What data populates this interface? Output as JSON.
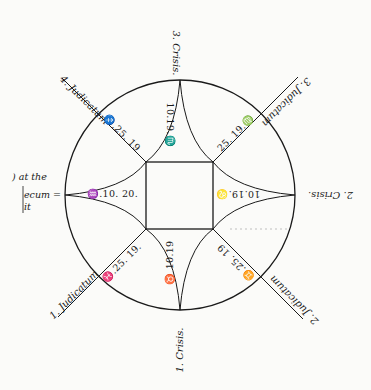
{
  "diagram": {
    "type": "astrological crisis/judicatum figure",
    "circle": {
      "cx": 180,
      "cy": 195,
      "r": 115
    },
    "center_square": {
      "x": 146,
      "y": 162,
      "w": 67,
      "h": 67
    },
    "ink_color": "#1a1a1a",
    "paper_color": "#fbfbf9"
  },
  "crises": {
    "top": "3. Crisis.",
    "right": "2. Crisis.",
    "bottom": "1. Crisis.",
    "left": ""
  },
  "judicata": {
    "upper_left": "4. Judicatum",
    "upper_right": "3. Judicatum",
    "lower_right": "2. Judicatum",
    "lower_left": "1. Judicatum"
  },
  "cardinal_values": {
    "top": "10.19.♏",
    "right": "10.19.♌",
    "bottom": "♉ 10.19",
    "left": "♒.10. 20."
  },
  "diagonal_values": {
    "upper_left": "♐.25. 19",
    "upper_right": "25. 19.♍",
    "lower_right": "♊.25. 19",
    "lower_left": "♓.25. 19."
  },
  "margin_text": {
    "line1": ") at the",
    "line2": "ecum =",
    "line3": "it"
  }
}
